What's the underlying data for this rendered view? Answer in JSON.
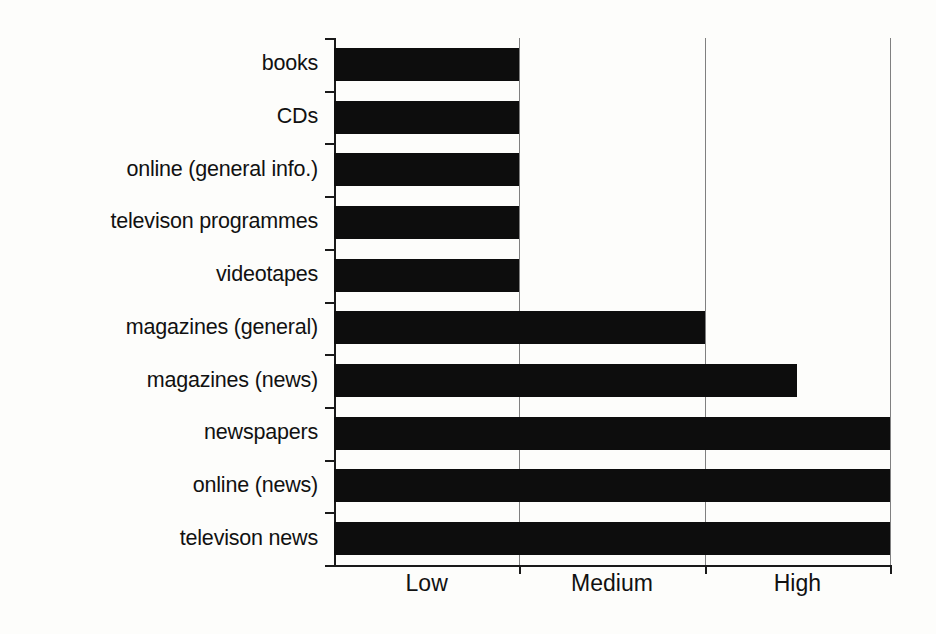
{
  "chart_data": {
    "type": "bar",
    "orientation": "horizontal",
    "title": "",
    "subtitle": "",
    "xlabel": "",
    "ylabel": "",
    "categories": [
      "books",
      "CDs",
      "online (general info.)",
      "televison programmes",
      "videotapes",
      "magazines (general)",
      "magazines (news)",
      "newspapers",
      "online (news)",
      "televison news"
    ],
    "values": [
      1,
      1,
      1,
      1,
      1,
      2,
      2.5,
      3,
      3,
      3
    ],
    "tick_labels": [
      "Low",
      "Medium",
      "High"
    ],
    "tick_values": [
      1,
      2,
      3
    ],
    "xlim": [
      0,
      3
    ],
    "ylim": [
      0,
      10
    ],
    "grid": true,
    "grid_axis": "x",
    "legend": false,
    "legend_position": "none",
    "bar_color": "#0d0d0d",
    "axis_color": "#1a1a1a",
    "background_color": "#fdfdfb"
  }
}
